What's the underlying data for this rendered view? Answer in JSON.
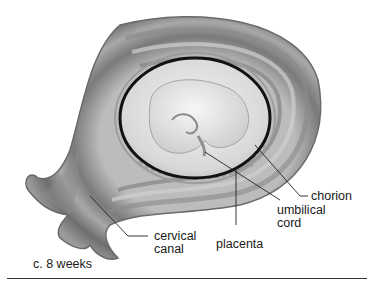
{
  "figure": {
    "caption": "c. 8 weeks",
    "labels": [
      {
        "id": "chorion",
        "lines": [
          "chorion"
        ]
      },
      {
        "id": "umbilical-cord",
        "lines": [
          "umbilical",
          "cord"
        ]
      },
      {
        "id": "placenta",
        "lines": [
          "placenta"
        ]
      },
      {
        "id": "cervical-canal",
        "lines": [
          "cervical",
          "canal"
        ]
      }
    ]
  },
  "colors": {
    "background": "#ffffff",
    "uterus_wall_dark": "#6f6f6f",
    "uterus_wall_light": "#bdbdbd",
    "sac_outline": "#111111",
    "embryo": "#e6e6e6",
    "leader_lines": "#222222",
    "text": "#1a1a1a"
  }
}
